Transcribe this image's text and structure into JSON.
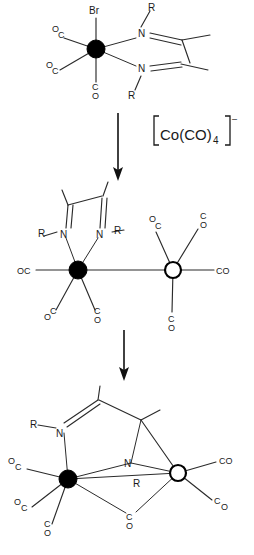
{
  "figure": {
    "kind": "reaction-scheme",
    "background": "#ffffff",
    "ink": "#1a1a1a"
  },
  "reagent": {
    "formula_prefix": "Co(CO)",
    "subscript": "4",
    "charge": "–",
    "bracket_left": "[",
    "bracket_right": "]"
  },
  "labels": {
    "bromide": "Br",
    "carbonyl": "CO",
    "carbonyl_rev": "OC",
    "carbon": "C",
    "oxygen": "O",
    "nitrogen": "N",
    "substituent": "R"
  },
  "structures": [
    {
      "id": "reactant",
      "name": "bromo-metal-carbonyl-diazadiene",
      "metal_centers": [
        {
          "type": "filled",
          "label": ""
        }
      ],
      "ligands": [
        "Br",
        "CO",
        "CO",
        "CO",
        "N",
        "N"
      ],
      "ligand_labels": {
        "axial_top": "Br",
        "co_upper_left_o": "O",
        "co_upper_left_c": "C",
        "co_left_o": "O",
        "co_left_c": "C",
        "co_bottom_c": "C",
        "co_bottom_o": "O",
        "n_top": "N",
        "n_bottom": "N",
        "r_top": "R",
        "r_bottom": "R"
      }
    },
    {
      "id": "intermediate",
      "name": "dinuclear-metal-metal-bonded",
      "metal_centers": [
        {
          "type": "filled"
        },
        {
          "type": "open"
        }
      ],
      "ligand_labels": {
        "r_left": "R",
        "n_left": "N",
        "n_right": "N",
        "r_right": "R",
        "oc_left": "OC",
        "co_lower_o": "O",
        "co_lower_c": "C",
        "co_lower2_c": "C",
        "co_lower2_o": "O",
        "oc_up_o": "O",
        "oc_up_c": "C",
        "co_up_c": "C",
        "co_up_o": "O",
        "co_right": "CO",
        "co_down_c": "C",
        "co_down_o": "O"
      }
    },
    {
      "id": "product",
      "name": "n-bridged-dinuclear-cluster",
      "metal_centers": [
        {
          "type": "filled"
        },
        {
          "type": "open"
        }
      ],
      "ligand_labels": {
        "r_top": "R",
        "n_imine": "N",
        "n_bridge": "N",
        "r_bridge": "R",
        "oc_1_o": "O",
        "oc_1_c": "C",
        "oc_2_o": "O",
        "oc_2_c": "C",
        "oc_3_c": "C",
        "oc_3_o": "O",
        "co_bridge_c": "C",
        "co_bridge_o": "O",
        "co_right_1": "CO",
        "co_right_2_c": "C",
        "co_right_2_o": "O"
      }
    }
  ],
  "arrows": [
    {
      "id": "arrow-1",
      "direction": "down"
    },
    {
      "id": "arrow-2",
      "direction": "down"
    }
  ]
}
